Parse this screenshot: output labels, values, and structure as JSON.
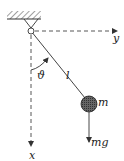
{
  "diagram": {
    "type": "simple-pendulum",
    "labels": {
      "y_axis": "y",
      "x_axis": "x",
      "angle": "ϑ",
      "length": "l",
      "mass": "m",
      "weight": "mg"
    },
    "colors": {
      "line": "#333333",
      "mass_fill": "#555555",
      "background": "#ffffff"
    }
  }
}
